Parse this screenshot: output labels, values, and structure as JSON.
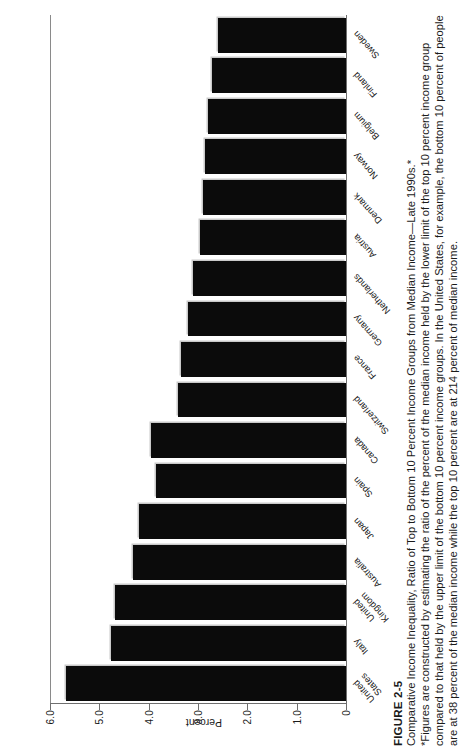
{
  "figure": {
    "number": "FIGURE 2-5",
    "title": "Comparative Income Inequality, Ratio of Top to Bottom 10 Percent Income Groups from Median Income—Late 1990s.*",
    "note": "*Figures are constructed by estimating the ratio of the percent of the median income held by the lower limit of the top 10 percent income group compared to that held by the upper limit of the bottom 10 percent income groups. In the United States, for example, the bottom 10 percent of people are at 38 percent of the median income while the top 10 percent are at 214 percent of median income."
  },
  "chart_data": {
    "type": "bar",
    "title": "Comparative Income Inequality, Ratio of Top to Bottom 10 Percent Income Groups from Median Income—Late 1990s.*",
    "xlabel": "",
    "ylabel": "Percent",
    "ylim": [
      0,
      6.0
    ],
    "ytick_labels": [
      "0",
      "1.0",
      "2.0",
      "3.0",
      "4.0",
      "5.0",
      "6.0"
    ],
    "ytick_values": [
      0,
      1.0,
      2.0,
      3.0,
      4.0,
      5.0,
      6.0
    ],
    "grid": false,
    "legend": "none",
    "orientation": "vertical-bars-on-rotated-page",
    "categories": [
      "United States",
      "Italy",
      "United Kingdom",
      "Australia",
      "Japan",
      "Spain",
      "Canada",
      "Switzerland",
      "France",
      "Germany",
      "Netherlands",
      "Austria",
      "Denmark",
      "Norway",
      "Belgium",
      "Finland",
      "Sweden"
    ],
    "values": [
      5.67,
      4.76,
      4.69,
      4.31,
      4.2,
      3.85,
      3.95,
      3.4,
      3.35,
      3.2,
      3.1,
      2.96,
      2.9,
      2.85,
      2.8,
      2.72,
      2.6
    ],
    "bar_color": "#0b0b0b"
  },
  "axis": {
    "frame_color": "#6f6f6f"
  }
}
